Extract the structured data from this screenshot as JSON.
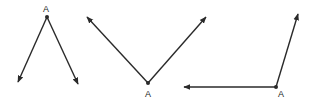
{
  "diagram": {
    "stroke_color": "#2a2a2a",
    "figures": [
      {
        "id": "angle-1",
        "vertex": {
          "x": 47,
          "y": 17
        },
        "label": "A",
        "label_pos": {
          "x": 46,
          "y": 12
        },
        "rays": [
          {
            "tip": {
              "x": 18,
              "y": 82
            }
          },
          {
            "tip": {
              "x": 78,
              "y": 84
            }
          }
        ]
      },
      {
        "id": "angle-2",
        "vertex": {
          "x": 148,
          "y": 83
        },
        "label": "A",
        "label_pos": {
          "x": 148,
          "y": 97
        },
        "rays": [
          {
            "tip": {
              "x": 87,
              "y": 17
            }
          },
          {
            "tip": {
              "x": 206,
              "y": 17
            }
          }
        ]
      },
      {
        "id": "angle-3",
        "vertex": {
          "x": 276,
          "y": 87
        },
        "label": "A",
        "label_pos": {
          "x": 281,
          "y": 97
        },
        "rays": [
          {
            "tip": {
              "x": 184,
              "y": 87
            }
          },
          {
            "tip": {
              "x": 298,
              "y": 14
            }
          }
        ]
      }
    ]
  }
}
